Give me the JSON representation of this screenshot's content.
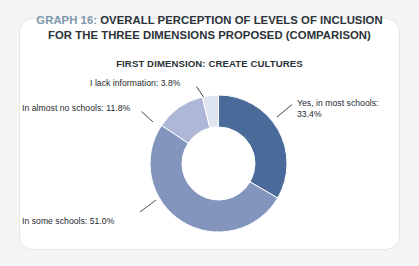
{
  "card": {
    "title_line1_prefix": "GRAPH 16:",
    "title_line1_rest": " OVERALL PERCEPTION OF LEVELS OF INCLUSION",
    "title_line2": "FOR THE THREE DIMENSIONS PROPOSED (COMPARISON)",
    "subtitle": "FIRST DIMENSION: CREATE CULTURES"
  },
  "colors": {
    "graph_number": "#7d98ad",
    "title_text": "#2c3338",
    "card_bg": "#ffffff",
    "card_border": "#e4e6e8",
    "page_bg": "#f3f4f5",
    "slice_yes": "#4a6b99",
    "slice_some": "#8395bc",
    "slice_almost": "#aeb8d6",
    "slice_lack": "#dfe5f0",
    "leader_line": "#2c3338"
  },
  "labels": {
    "lack": "I lack information: 3.8%",
    "almost": "In almost no schools: 11.8%",
    "some": "In some schools: 51.0%",
    "yes": "Yes, in most schools: 33.4%"
  },
  "chart_data": {
    "type": "pie",
    "variant": "donut",
    "title": "GRAPH 16: OVERALL PERCEPTION OF LEVELS OF INCLUSION FOR THE THREE DIMENSIONS PROPOSED (COMPARISON)",
    "subtitle": "FIRST DIMENSION: CREATE CULTURES",
    "xlabel": "",
    "ylabel": "",
    "grid": false,
    "legend": "none",
    "labels_position": "outside-with-leader-lines",
    "units": "percent",
    "start_angle_deg": 0,
    "direction": "clockwise",
    "inner_radius_ratio": 0.53,
    "categories": [
      "Yes, in most schools",
      "In some schools",
      "In almost no schools",
      "I lack information"
    ],
    "values": [
      33.4,
      51.0,
      11.8,
      3.8
    ],
    "value_labels": [
      "33.4%",
      "51.0%",
      "11.8%",
      "3.8%"
    ],
    "colors": [
      "#4a6b99",
      "#8395bc",
      "#aeb8d6",
      "#dfe5f0"
    ],
    "total": 100.0
  }
}
